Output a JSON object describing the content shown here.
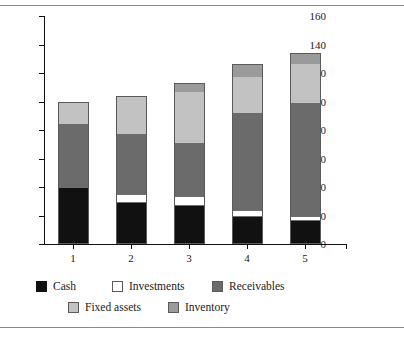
{
  "chart_data": {
    "type": "bar",
    "stacked": true,
    "title": "",
    "subtitle": "",
    "xlabel": "",
    "ylabel": "",
    "categories": [
      "1",
      "2",
      "3",
      "4",
      "5"
    ],
    "ylim": [
      0,
      160
    ],
    "yticks": [
      0,
      20,
      40,
      60,
      80,
      100,
      120,
      140,
      160
    ],
    "ytick_labels": [
      "0",
      "20",
      "40",
      "60",
      "80",
      "100",
      "120",
      "140",
      "160"
    ],
    "grid": false,
    "legend_position": "bottom",
    "series": [
      {
        "name": "Cash",
        "color": "#111111",
        "values": [
          39,
          29,
          27,
          19,
          16
        ]
      },
      {
        "name": "Investments",
        "color": "#ffffff",
        "values": [
          1,
          6,
          6.5,
          5,
          4
        ]
      },
      {
        "name": "Receivables",
        "color": "#6b6b6b",
        "values": [
          44,
          42,
          37.5,
          68,
          79
        ]
      },
      {
        "name": "Fixed assets",
        "color": "#c2c2c2",
        "values": [
          16,
          26,
          36,
          25,
          27
        ]
      },
      {
        "name": "Inventory",
        "color": "#9a9a9a",
        "values": [
          0,
          1,
          6,
          9,
          8
        ]
      }
    ],
    "totals": [
      100,
      104,
      113,
      126,
      134
    ]
  },
  "legend": {
    "items": [
      {
        "label": "Cash",
        "swatch": "cash-swatch"
      },
      {
        "label": "Investments",
        "swatch": "investments-swatch"
      },
      {
        "label": "Receivables",
        "swatch": "receivables-swatch"
      },
      {
        "label": "Fixed assets",
        "swatch": "fixed-assets-swatch"
      },
      {
        "label": "Inventory",
        "swatch": "inventory-swatch"
      }
    ]
  }
}
